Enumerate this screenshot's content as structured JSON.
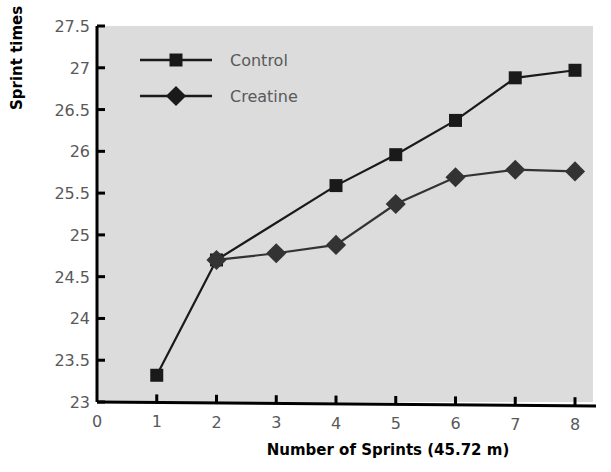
{
  "chart_data": {
    "type": "line",
    "title": "",
    "xlabel": "Number of Sprints (45.72 m)",
    "ylabel": "Sprint times (s)",
    "x": [
      1,
      2,
      3,
      4,
      5,
      6,
      7,
      8
    ],
    "xlim": [
      0,
      8
    ],
    "ylim": [
      23,
      27.5
    ],
    "xticks": [
      0,
      1,
      2,
      3,
      4,
      5,
      6,
      7,
      8
    ],
    "xtick_labels": [
      "0",
      "1",
      "2",
      "3",
      "4",
      "5",
      "6",
      "7",
      "8"
    ],
    "yticks": [
      23,
      23.5,
      24,
      24.5,
      25,
      25.5,
      26,
      26.5,
      27,
      27.5
    ],
    "ytick_labels": [
      "23",
      "23.5",
      "24",
      "24.5",
      "25",
      "25.5",
      "26",
      "26.5",
      "27",
      "27.5"
    ],
    "grid": false,
    "legend_position": "top-left-inside",
    "plot_background": "#dcdcdc",
    "series": [
      {
        "name": "Control",
        "marker": "square",
        "color": "#1a1a1a",
        "x": [
          1,
          2,
          3,
          4,
          5,
          6,
          7,
          8
        ],
        "values": [
          23.32,
          24.7,
          null,
          25.59,
          25.96,
          26.37,
          26.88,
          26.97
        ]
      },
      {
        "name": "Creatine",
        "marker": "diamond",
        "color": "#333333",
        "x": [
          2,
          3,
          4,
          5,
          6,
          7,
          8
        ],
        "values": [
          24.7,
          24.78,
          24.88,
          25.37,
          25.69,
          25.78,
          25.76
        ]
      }
    ]
  },
  "legend": {
    "items": [
      {
        "label": "Control",
        "marker": "square"
      },
      {
        "label": "Creatine",
        "marker": "diamond"
      }
    ]
  },
  "axes": {
    "y_title": "Sprint times (s)",
    "x_title": "Number of Sprints (45.72 m)"
  }
}
